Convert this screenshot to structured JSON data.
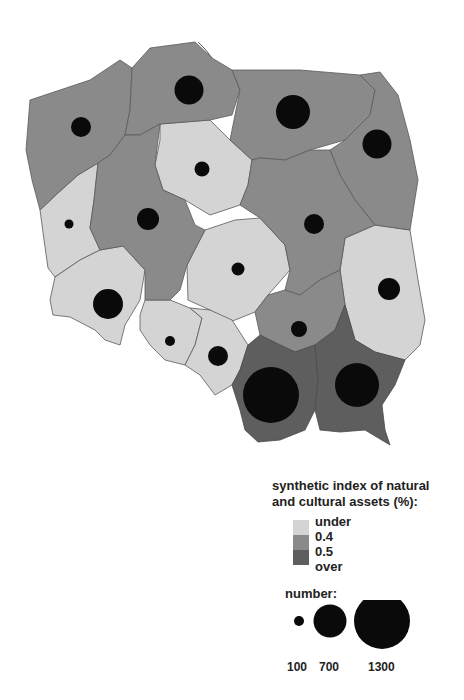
{
  "map": {
    "title": "Poland voivodeships",
    "colors": {
      "under_0_4": "#d4d4d4",
      "0_4_to_0_5": "#8a8a8a",
      "over_0_5": "#5e5e5e",
      "border": "#5a5a5a",
      "symbol": "#0a0a0a"
    },
    "regions": [
      {
        "name": "zachodniopomorskie",
        "class": "0.4-0.5",
        "symbol_value": 420
      },
      {
        "name": "pomorskie",
        "class": "0.4-0.5",
        "symbol_value": 620
      },
      {
        "name": "warminsko-mazurskie",
        "class": "0.4-0.5",
        "symbol_value": 850
      },
      {
        "name": "podlaskie",
        "class": "0.4-0.5",
        "symbol_value": 640
      },
      {
        "name": "kujawsko-pomorskie",
        "class": "under 0.4",
        "symbol_value": 200
      },
      {
        "name": "lubuskie",
        "class": "under 0.4",
        "symbol_value": 100
      },
      {
        "name": "wielkopolskie",
        "class": "0.4-0.5",
        "symbol_value": 400
      },
      {
        "name": "mazowieckie",
        "class": "0.4-0.5",
        "symbol_value": 330
      },
      {
        "name": "lodzkie",
        "class": "under 0.4",
        "symbol_value": 160
      },
      {
        "name": "lubelskie",
        "class": "under 0.4",
        "symbol_value": 390
      },
      {
        "name": "dolnoslaskie",
        "class": "under 0.4",
        "symbol_value": 700
      },
      {
        "name": "opolskie",
        "class": "under 0.4",
        "symbol_value": 110
      },
      {
        "name": "slaskie",
        "class": "under 0.4",
        "symbol_value": 300
      },
      {
        "name": "swietokrzyskie",
        "class": "0.4-0.5",
        "symbol_value": 250
      },
      {
        "name": "malopolskie",
        "class": "over 0.5",
        "symbol_value": 1300
      },
      {
        "name": "podkarpackie",
        "class": "over 0.5",
        "symbol_value": 1000
      }
    ]
  },
  "legend": {
    "title_line1": "synthetic index of natural",
    "title_line2": "and cultural assets (%):",
    "class_labels": [
      "under",
      "0.4",
      "0.5",
      "over"
    ],
    "number_title": "number:",
    "size_labels": [
      "100",
      "700",
      "1300"
    ]
  }
}
